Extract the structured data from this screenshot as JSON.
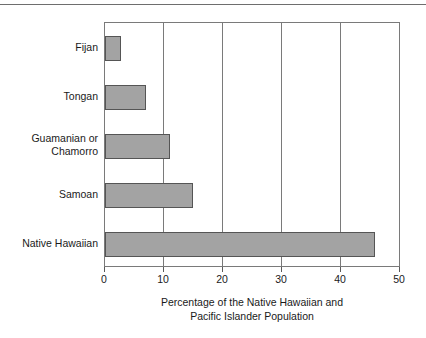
{
  "chart_data": {
    "type": "bar",
    "orientation": "horizontal",
    "title": "",
    "subtitle": "",
    "xlabel": "Percentage of the Native Hawaiian and Pacific Islander Population",
    "xlabel_line1": "Percentage of the Native Hawaiian and",
    "xlabel_line2": "Pacific Islander Population",
    "ylabel": "",
    "categories": [
      "Native Hawaiian",
      "Samoan",
      "Guamanian or Chamorro",
      "Tongan",
      "Fijan"
    ],
    "values": [
      46,
      15,
      11,
      7,
      2.7
    ],
    "xlim": [
      0,
      50
    ],
    "xticks": [
      0,
      10,
      20,
      30,
      40,
      50
    ],
    "xtick_labels": [
      "0",
      "10",
      "20",
      "30",
      "40",
      "50"
    ],
    "grid": "vertical",
    "legend": "none",
    "bar_fill_color": "#a3a3a3",
    "bar_edge_color": "#555555",
    "frame_color": "#7a7a7a"
  },
  "categories": [
    {
      "label": "Fijan",
      "label_line1": "Fijan",
      "label_line2": "",
      "value": 2.7
    },
    {
      "label": "Tongan",
      "label_line1": "Tongan",
      "label_line2": "",
      "value": 7
    },
    {
      "label": "Guamanian or Chamorro",
      "label_line1": "Guamanian or",
      "label_line2": "Chamorro",
      "value": 11
    },
    {
      "label": "Samoan",
      "label_line1": "Samoan",
      "label_line2": "",
      "value": 15
    },
    {
      "label": "Native Hawaiian",
      "label_line1": "Native Hawaiian",
      "label_line2": "",
      "value": 46
    }
  ],
  "xticks": [
    {
      "label": "0",
      "value": 0
    },
    {
      "label": "10",
      "value": 10
    },
    {
      "label": "20",
      "value": 20
    },
    {
      "label": "30",
      "value": 30
    },
    {
      "label": "40",
      "value": 40
    },
    {
      "label": "50",
      "value": 50
    }
  ],
  "axis_title": {
    "line1": "Percentage of the Native Hawaiian and",
    "line2": "Pacific Islander Population"
  }
}
